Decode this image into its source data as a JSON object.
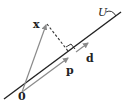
{
  "diagram": {
    "labels": {
      "origin": "0",
      "x": "x",
      "p": "p",
      "d": "d",
      "U": "U"
    },
    "colors": {
      "line": "#222222",
      "vector": "#8a8a8a",
      "dashed": "#333333",
      "text": "#222222"
    },
    "points": {
      "origin": [
        22,
        92
      ],
      "x": [
        47,
        23
      ],
      "p": [
        70,
        57
      ],
      "d_start": [
        75,
        53
      ],
      "d_end": [
        89,
        42
      ]
    }
  }
}
